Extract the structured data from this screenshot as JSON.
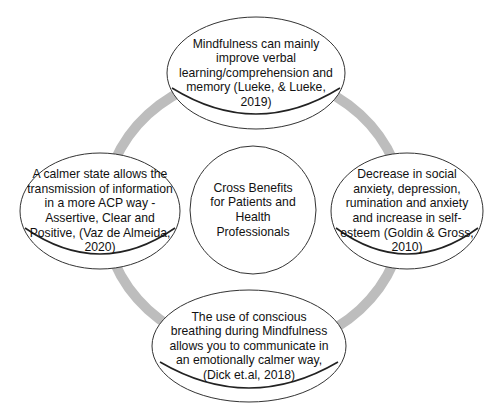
{
  "diagram": {
    "colors": {
      "ring": "#bdbdbd",
      "stroke": "#333333",
      "fill": "#ffffff",
      "text": "#111111"
    },
    "center": {
      "label": "Cross Benefits for Patients and Health Professionals"
    },
    "nodes": {
      "top": {
        "label": "Mindfulness can mainly improve verbal learning/comprehension and memory (Lueke, & Lueke, 2019)"
      },
      "left": {
        "label": "A calmer state allows the transmission of information in a more ACP way - Assertive, Clear and Positive, (Vaz de Almeida, 2020)"
      },
      "right": {
        "label": "Decrease in social anxiety, depression, rumination and anxiety and increase in self-esteem (Goldin & Gross, 2010)"
      },
      "bottom": {
        "label": "The use of conscious breathing during Mindfulness allows you to communicate in an emotionally calmer way, (Dick et.al, 2018)"
      }
    }
  }
}
